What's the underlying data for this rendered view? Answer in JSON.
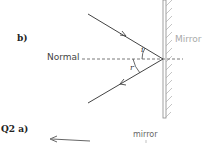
{
  "part_b": {
    "label": "b)",
    "normal_label": "Normal",
    "mirror_label": "Mirror",
    "angle_incidence": "i",
    "angle_reflection": "r"
  },
  "q2": {
    "label": "Q2 a)",
    "mirror_label": "mirror"
  },
  "colors": {
    "ray": "#444444",
    "mirror_line": "#888888",
    "mirror_label": "#aaaaaa"
  }
}
